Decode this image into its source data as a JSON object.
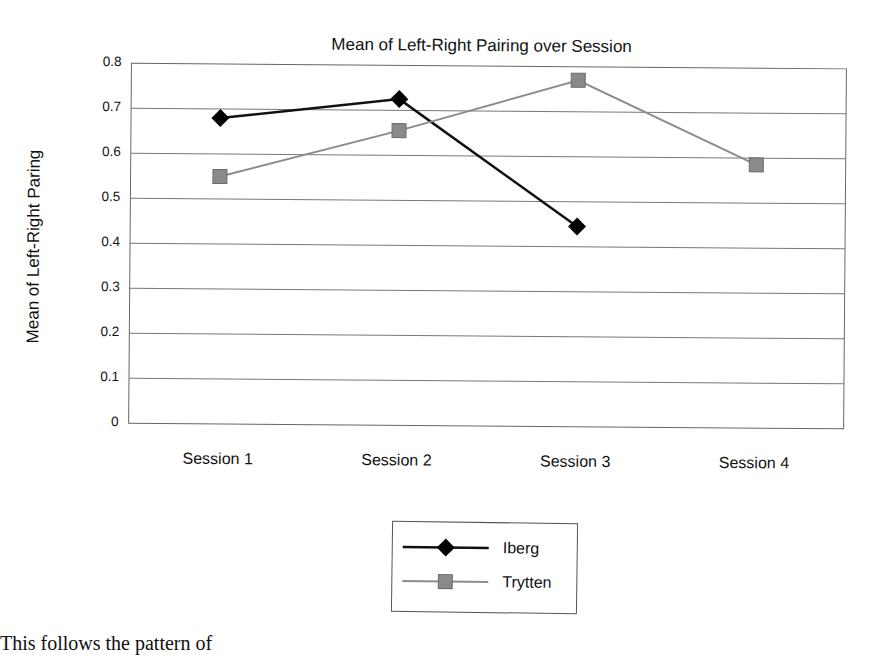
{
  "chart_data": {
    "type": "line",
    "title": "Mean of Left-Right Pairing over Session",
    "xlabel": "",
    "ylabel": "Mean of Left-Right Paring",
    "categories": [
      "Session 1",
      "Session 2",
      "Session 3",
      "Session 4"
    ],
    "series": [
      {
        "name": "Iberg",
        "marker": "diamond",
        "color": "#111111",
        "values": [
          0.68,
          0.725,
          0.445,
          null
        ]
      },
      {
        "name": "Trytten",
        "marker": "square",
        "color": "#8c8c8c",
        "values": [
          0.55,
          0.655,
          0.77,
          0.585
        ]
      }
    ],
    "ylim": [
      0,
      0.8
    ],
    "yticks": [
      "0",
      "0.1",
      "0.2",
      "0.3",
      "0.4",
      "0.5",
      "0.6",
      "0.7",
      "0.8"
    ],
    "grid": true,
    "legend_position": "bottom"
  },
  "legend": {
    "items": [
      {
        "label": "Iberg"
      },
      {
        "label": "Trytten"
      }
    ]
  },
  "footer_text": "This follows the pattern of"
}
